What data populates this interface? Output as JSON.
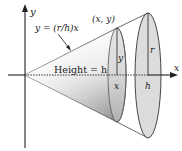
{
  "figure": {
    "type": "cone-of-revolution",
    "axes": {
      "x_label": "x",
      "y_label": "y"
    },
    "line_label": "y = (r/h)x",
    "point_label": "(x, y)",
    "height_label": "Height = h",
    "inner_slice": {
      "radius_label": "y",
      "position_label": "x"
    },
    "outer_base": {
      "radius_label": "r",
      "position_label": "h"
    },
    "colors": {
      "cone_fill_light": "#f2f2f2",
      "cone_fill_dark": "#9a9a9a",
      "disk_fill": "#d9d9d9",
      "stroke": "#333333"
    }
  }
}
